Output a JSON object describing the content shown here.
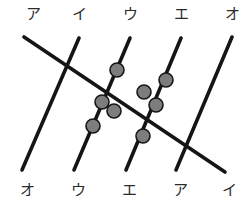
{
  "figure": {
    "width": 250,
    "height": 206,
    "background": "#ffffff",
    "line_color": "#151515",
    "node_fill": "#7d7d7d",
    "node_stroke": "#171717",
    "label_color": "#2b2b2b"
  },
  "top_labels": [
    {
      "text": "ア",
      "x": 33,
      "y": 14
    },
    {
      "text": "イ",
      "x": 79,
      "y": 14
    },
    {
      "text": "ウ",
      "x": 130,
      "y": 14
    },
    {
      "text": "エ",
      "x": 181,
      "y": 14
    },
    {
      "text": "オ",
      "x": 232,
      "y": 14
    }
  ],
  "bottom_labels": [
    {
      "text": "オ",
      "x": 27,
      "y": 190
    },
    {
      "text": "ウ",
      "x": 78,
      "y": 190
    },
    {
      "text": "エ",
      "x": 129,
      "y": 190
    },
    {
      "text": "ア",
      "x": 180,
      "y": 190
    },
    {
      "text": "イ",
      "x": 229,
      "y": 190
    }
  ],
  "edges": [
    {
      "name": "line-a-top-left-to-bottom-right",
      "x1": 24,
      "y1": 37,
      "x2": 225,
      "y2": 172
    },
    {
      "name": "line-b-top-second-to-bottom-left",
      "x1": 79,
      "y1": 38,
      "x2": 22,
      "y2": 170
    },
    {
      "name": "line-c-top-third-to-bottom-second",
      "x1": 130,
      "y1": 38,
      "x2": 74,
      "y2": 170
    },
    {
      "name": "line-d-top-fourth-to-bottom-third",
      "x1": 181,
      "y1": 38,
      "x2": 126,
      "y2": 170
    },
    {
      "name": "line-e-top-fifth-to-bottom-fourth",
      "x1": 232,
      "y1": 37,
      "x2": 176,
      "y2": 170
    }
  ],
  "nodes": [
    {
      "name": "node-upper-center",
      "x": 117,
      "y": 70,
      "r": 7
    },
    {
      "name": "node-upper-right",
      "x": 166,
      "y": 80,
      "r": 7
    },
    {
      "name": "node-center",
      "x": 144,
      "y": 92,
      "r": 7
    },
    {
      "name": "node-left-upper",
      "x": 102,
      "y": 102,
      "r": 7
    },
    {
      "name": "node-right-lower",
      "x": 156,
      "y": 105,
      "r": 7
    },
    {
      "name": "node-left-lower",
      "x": 114,
      "y": 111,
      "r": 7
    },
    {
      "name": "node-lower-left",
      "x": 93,
      "y": 126,
      "r": 7
    },
    {
      "name": "node-lower-center",
      "x": 143,
      "y": 136,
      "r": 7
    }
  ]
}
